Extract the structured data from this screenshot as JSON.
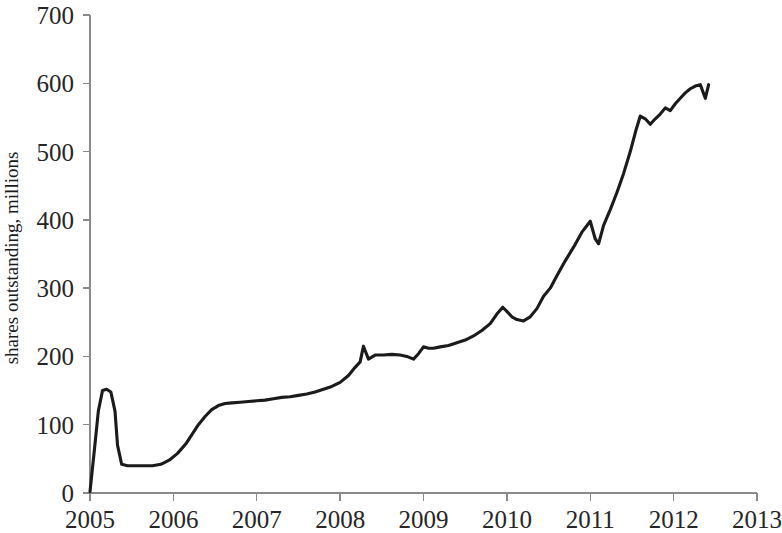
{
  "chart_data": {
    "type": "line",
    "title": "",
    "subtitle": "",
    "xlabel": "",
    "ylabel": "shares outstanding, millions",
    "xlim": [
      2005,
      2013
    ],
    "ylim": [
      0,
      700
    ],
    "xticks": [
      2005,
      2006,
      2007,
      2008,
      2009,
      2010,
      2011,
      2012,
      2013
    ],
    "xtick_labels": [
      "2005",
      "2006",
      "2007",
      "2008",
      "2009",
      "2010",
      "2011",
      "2012",
      "2013"
    ],
    "yticks": [
      0,
      100,
      200,
      300,
      400,
      500,
      600,
      700
    ],
    "ytick_labels": [
      "0",
      "100",
      "200",
      "300",
      "400",
      "500",
      "600",
      "700"
    ],
    "grid": false,
    "legend": false,
    "legend_position": "none",
    "line_color": "#1b1b1b",
    "axis_color": "#8a8a8a",
    "series": [
      {
        "name": "shares outstanding",
        "x": [
          2005.0,
          2005.05,
          2005.1,
          2005.15,
          2005.2,
          2005.25,
          2005.3,
          2005.33,
          2005.38,
          2005.45,
          2005.55,
          2005.65,
          2005.75,
          2005.85,
          2005.95,
          2006.05,
          2006.15,
          2006.22,
          2006.3,
          2006.38,
          2006.46,
          2006.54,
          2006.62,
          2006.7,
          2006.8,
          2006.9,
          2007.0,
          2007.1,
          2007.2,
          2007.3,
          2007.4,
          2007.5,
          2007.6,
          2007.7,
          2007.8,
          2007.9,
          2008.0,
          2008.1,
          2008.18,
          2008.24,
          2008.28,
          2008.34,
          2008.42,
          2008.52,
          2008.62,
          2008.72,
          2008.8,
          2008.88,
          2008.94,
          2009.0,
          2009.06,
          2009.12,
          2009.2,
          2009.3,
          2009.4,
          2009.5,
          2009.6,
          2009.7,
          2009.8,
          2009.88,
          2009.95,
          2010.0,
          2010.06,
          2010.12,
          2010.2,
          2010.28,
          2010.36,
          2010.44,
          2010.52,
          2010.6,
          2010.7,
          2010.8,
          2010.9,
          2011.0,
          2011.06,
          2011.1,
          2011.16,
          2011.24,
          2011.32,
          2011.4,
          2011.48,
          2011.55,
          2011.6,
          2011.66,
          2011.72,
          2011.78,
          2011.84,
          2011.9,
          2011.96,
          2012.02,
          2012.08,
          2012.14,
          2012.2,
          2012.26,
          2012.32,
          2012.38,
          2012.42
        ],
        "values": [
          2,
          60,
          120,
          150,
          152,
          148,
          120,
          70,
          42,
          40,
          40,
          40,
          40,
          42,
          48,
          58,
          72,
          85,
          100,
          112,
          122,
          128,
          131,
          132,
          133,
          134,
          135,
          136,
          138,
          140,
          141,
          143,
          145,
          148,
          152,
          156,
          162,
          172,
          184,
          192,
          215,
          196,
          202,
          202,
          203,
          202,
          200,
          196,
          204,
          214,
          212,
          212,
          214,
          216,
          220,
          224,
          230,
          238,
          248,
          262,
          272,
          266,
          258,
          254,
          252,
          258,
          270,
          288,
          300,
          318,
          340,
          360,
          382,
          398,
          372,
          365,
          392,
          415,
          440,
          468,
          500,
          532,
          552,
          548,
          540,
          548,
          555,
          564,
          560,
          570,
          578,
          586,
          592,
          596,
          598,
          578,
          598
        ]
      }
    ]
  },
  "axis": {
    "y_title": "shares outstanding, millions"
  }
}
